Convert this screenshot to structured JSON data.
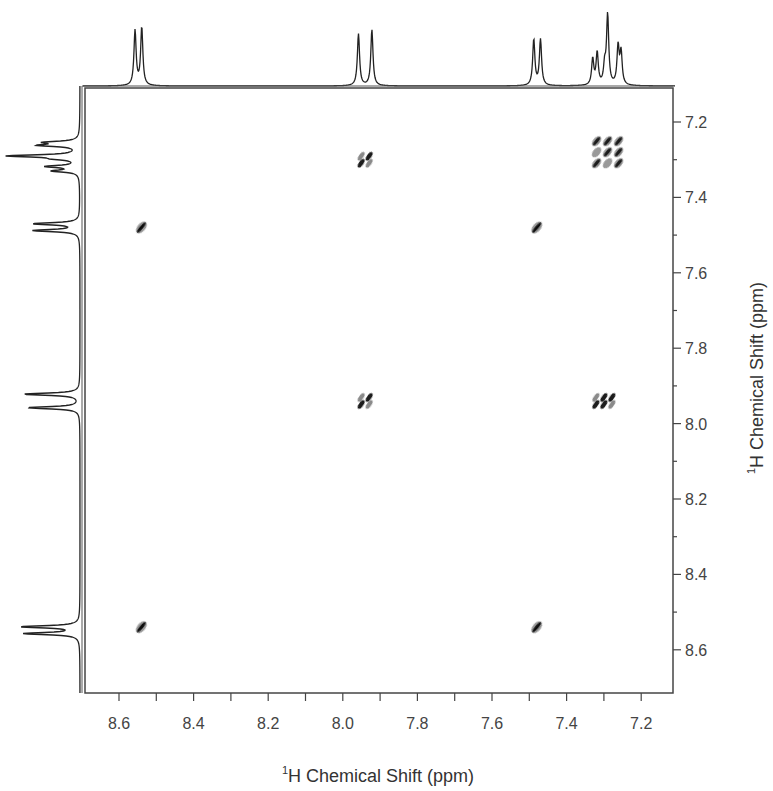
{
  "chart_data": {
    "type": "heatmap",
    "subtype": "2D NMR COSY contour plot",
    "title": "",
    "xlabel": "1H Chemical Shift (ppm)",
    "ylabel": "1H Chemical Shift (ppm)",
    "xlabel_parts": {
      "sup": "1",
      "text": "H Chemical Shift (ppm)"
    },
    "ylabel_parts": {
      "sup": "1",
      "text": "H Chemical Shift (ppm)"
    },
    "xlim": [
      8.7,
      7.1
    ],
    "ylim": [
      7.1,
      8.7
    ],
    "x_axis_reversed": true,
    "y_axis_position": "right",
    "x_ticks": [
      "8.6",
      "8.4",
      "8.2",
      "8.0",
      "7.8",
      "7.6",
      "7.4",
      "7.2"
    ],
    "x_tick_values": [
      8.6,
      8.4,
      8.2,
      8.0,
      7.8,
      7.6,
      7.4,
      7.2
    ],
    "y_ticks": [
      "7.2",
      "7.4",
      "7.6",
      "7.8",
      "8.0",
      "8.2",
      "8.4",
      "8.6"
    ],
    "y_tick_values": [
      7.2,
      7.4,
      7.6,
      7.8,
      8.0,
      8.2,
      8.4,
      8.6
    ],
    "minor_tick_step": 0.1,
    "grid": false,
    "legend": null,
    "projection_1d_peaks_ppm": [
      {
        "shift": 8.54,
        "multiplicity": "doublet"
      },
      {
        "shift": 7.94,
        "multiplicity": "doublet"
      },
      {
        "shift": 7.48,
        "multiplicity": "doublet"
      },
      {
        "shift": 7.29,
        "multiplicity": "multiplet"
      }
    ],
    "peaks": [
      {
        "x": 8.54,
        "y": 7.48,
        "type": "cross",
        "pattern": "single"
      },
      {
        "x": 8.54,
        "y": 8.54,
        "type": "diagonal",
        "pattern": "single"
      },
      {
        "x": 7.94,
        "y": 7.3,
        "type": "cross",
        "pattern": "2x2"
      },
      {
        "x": 7.94,
        "y": 7.94,
        "type": "diagonal",
        "pattern": "2x2"
      },
      {
        "x": 7.48,
        "y": 7.48,
        "type": "diagonal",
        "pattern": "single"
      },
      {
        "x": 7.48,
        "y": 8.54,
        "type": "cross",
        "pattern": "single"
      },
      {
        "x": 7.29,
        "y": 7.28,
        "type": "diagonal",
        "pattern": "3x3"
      },
      {
        "x": 7.3,
        "y": 7.94,
        "type": "cross",
        "pattern": "2x3"
      }
    ]
  }
}
